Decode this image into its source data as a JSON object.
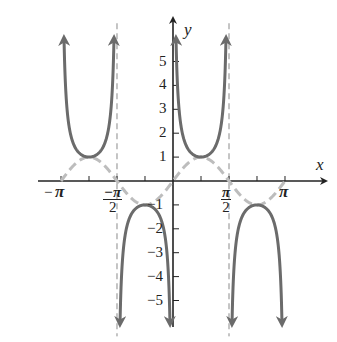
{
  "chart_data": {
    "type": "line",
    "title": "",
    "xlabel": "x",
    "ylabel": "y",
    "xlim": [
      -3.4,
      3.6
    ],
    "ylim": [
      -6.2,
      6.5
    ],
    "grid": false,
    "x_ticks": [
      {
        "value": -3.14159,
        "label": "−π"
      },
      {
        "value": -2.35619,
        "label": ""
      },
      {
        "value": -1.5708,
        "label": "−π/2"
      },
      {
        "value": -0.7854,
        "label": ""
      },
      {
        "value": 0.7854,
        "label": ""
      },
      {
        "value": 1.5708,
        "label": "π/2"
      },
      {
        "value": 2.35619,
        "label": ""
      },
      {
        "value": 3.14159,
        "label": "π"
      }
    ],
    "y_ticks": [
      -5,
      -4,
      -3,
      -2,
      -1,
      1,
      2,
      3,
      4,
      5
    ],
    "y_tick_labels": [
      "−5",
      "−4",
      "−3",
      "−2",
      "−1",
      "1",
      "2",
      "3",
      "4",
      "5"
    ],
    "asymptotes": [
      -1.5708,
      1.5708
    ],
    "series": [
      {
        "name": "y = csc 2x",
        "style": "solid dark gray with arrows",
        "color": "#6b6b6b",
        "branches": [
          {
            "x_range": [
              -3.1416,
              -1.5708
            ],
            "vertex": [
              -2.3562,
              1
            ],
            "direction": "up"
          },
          {
            "x_range": [
              -1.5708,
              0
            ],
            "vertex": [
              -0.7854,
              -1
            ],
            "direction": "down"
          },
          {
            "x_range": [
              0,
              1.5708
            ],
            "vertex": [
              0.7854,
              1
            ],
            "direction": "up"
          },
          {
            "x_range": [
              1.5708,
              3.1416
            ],
            "vertex": [
              2.3562,
              -1
            ],
            "direction": "down"
          }
        ]
      },
      {
        "name": "y = sin 2x",
        "style": "dashed light gray",
        "color": "#bdbdbd",
        "x": [
          -3.1416,
          -2.3562,
          -1.5708,
          -0.7854,
          0,
          0.7854,
          1.5708,
          2.3562,
          3.1416
        ],
        "y": [
          0,
          1,
          0,
          -1,
          0,
          1,
          0,
          -1,
          0
        ]
      }
    ]
  },
  "axes": {
    "x_label": "x",
    "y_label": "y"
  }
}
